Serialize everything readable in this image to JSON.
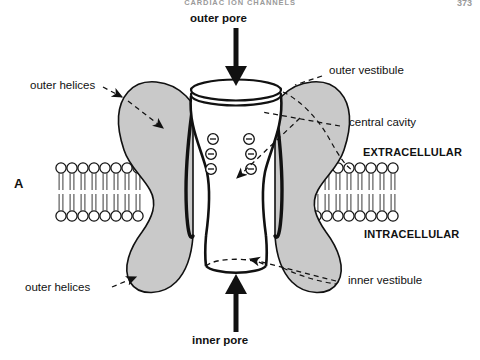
{
  "page": {
    "running_head": "CARDIAC ION CHANNELS",
    "page_number": "373"
  },
  "figure": {
    "panel_letter": "A",
    "title_top": "outer pore",
    "title_bottom": "inner pore",
    "labels": {
      "outer_helices_top": "outer helices",
      "outer_helices_bottom": "outer helices",
      "outer_vestibule": "outer vestibule",
      "central_cavity": "central cavity",
      "inner_vestibule": "inner vestibule",
      "extracellular": "EXTRACELLULAR",
      "intracellular": "INTRACELLULAR"
    },
    "charges": {
      "symbol": "−",
      "count_left": 3,
      "count_right": 3
    },
    "membrane": {
      "leaflet_lipid_count_left": 9,
      "leaflet_lipid_count_right": 9
    },
    "colors": {
      "subunit_fill": "#c9c9c9",
      "outline": "#111111",
      "background": "#ffffff",
      "header_text": "#9a9a9a",
      "label_text": "#111111"
    }
  }
}
